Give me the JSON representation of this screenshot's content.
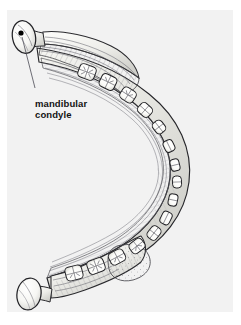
{
  "figure": {
    "view": "superior-oblique",
    "background_color": "#f2f2f2",
    "page_color": "#ffffff",
    "ink_color": "#1a1a1a",
    "tooth_fill": "#ffffff",
    "bone_fill": "#fbfbf9",
    "shade_color": "#9a9a9a"
  },
  "annotations": {
    "callout": {
      "text": "mandibular\ncondyle",
      "line1": "mandibular",
      "line2": "condyle",
      "text_color": "#121212",
      "marker": "dot",
      "marker_color": "#000000",
      "leader_line_color": "#55555f"
    }
  },
  "parts": {
    "upper_condyle": "mandibular condyle",
    "lower_condyle": "mandibular condyle",
    "ramus": "ramus of mandible",
    "body": "body of mandible",
    "dental_arch": "mandibular dental arch",
    "muscle_fibers": "masticatory muscle striations"
  },
  "teeth": {
    "upper_row_count": 8,
    "lower_row_count": 8,
    "anterior_count": 6
  }
}
